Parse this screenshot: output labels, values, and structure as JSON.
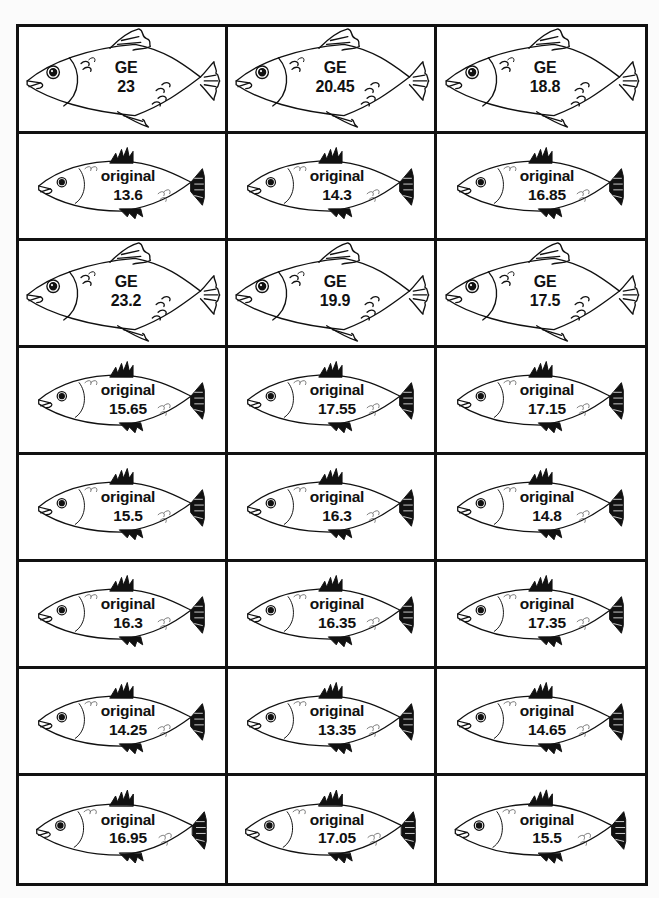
{
  "worksheet": {
    "colors": {
      "border": "#111111",
      "background": "#ffffff",
      "text": "#111111"
    },
    "rows": [
      [
        {
          "type": "GE",
          "label": "GE",
          "value": "23"
        },
        {
          "type": "GE",
          "label": "GE",
          "value": "20.45"
        },
        {
          "type": "GE",
          "label": "GE",
          "value": "18.8"
        }
      ],
      [
        {
          "type": "original",
          "label": "original",
          "value": "13.6"
        },
        {
          "type": "original",
          "label": "original",
          "value": "14.3"
        },
        {
          "type": "original",
          "label": "original",
          "value": "16.85"
        }
      ],
      [
        {
          "type": "GE",
          "label": "GE",
          "value": "23.2"
        },
        {
          "type": "GE",
          "label": "GE",
          "value": "19.9"
        },
        {
          "type": "GE",
          "label": "GE",
          "value": "17.5"
        }
      ],
      [
        {
          "type": "original",
          "label": "original",
          "value": "15.65"
        },
        {
          "type": "original",
          "label": "original",
          "value": "17.55"
        },
        {
          "type": "original",
          "label": "original",
          "value": "17.15"
        }
      ],
      [
        {
          "type": "original",
          "label": "original",
          "value": "15.5"
        },
        {
          "type": "original",
          "label": "original",
          "value": "16.3"
        },
        {
          "type": "original",
          "label": "original",
          "value": "14.8"
        }
      ],
      [
        {
          "type": "original",
          "label": "original",
          "value": "16.3"
        },
        {
          "type": "original",
          "label": "original",
          "value": "16.35"
        },
        {
          "type": "original",
          "label": "original",
          "value": "17.35"
        }
      ],
      [
        {
          "type": "original",
          "label": "original",
          "value": "14.25"
        },
        {
          "type": "original",
          "label": "original",
          "value": "13.35"
        },
        {
          "type": "original",
          "label": "original",
          "value": "14.65"
        }
      ],
      [
        {
          "type": "original",
          "label": "original",
          "value": "16.95"
        },
        {
          "type": "original",
          "label": "original",
          "value": "17.05"
        },
        {
          "type": "original",
          "label": "original",
          "value": "15.5"
        }
      ]
    ],
    "icons": {
      "GE": "large-fish-icon",
      "original": "small-fish-icon"
    }
  }
}
